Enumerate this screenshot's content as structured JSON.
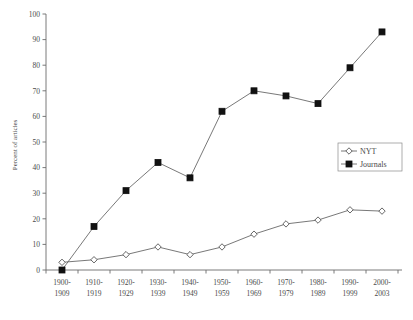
{
  "chart_data": {
    "type": "line",
    "title": "",
    "xlabel": "",
    "ylabel": "Percent of articles",
    "ylim": [
      0,
      100
    ],
    "ytick_step": 10,
    "grid": false,
    "legend_position": "right",
    "categories": [
      "1900-1909",
      "1910-1919",
      "1920-1929",
      "1930-1939",
      "1940-1949",
      "1950-1959",
      "1960-1969",
      "1970-1979",
      "1980-1989",
      "1990-1999",
      "2000-2003"
    ],
    "categories_lines": [
      [
        "1900-",
        "1909"
      ],
      [
        "1910-",
        "1919"
      ],
      [
        "1920-",
        "1929"
      ],
      [
        "1930-",
        "1939"
      ],
      [
        "1940-",
        "1949"
      ],
      [
        "1950-",
        "1959"
      ],
      [
        "1960-",
        "1969"
      ],
      [
        "1970-",
        "1979"
      ],
      [
        "1980-",
        "1989"
      ],
      [
        "1990-",
        "1999"
      ],
      [
        "2000-",
        "2003"
      ]
    ],
    "ytick_labels": [
      "0",
      "10",
      "20",
      "30",
      "40",
      "50",
      "60",
      "70",
      "80",
      "90",
      "100"
    ],
    "ytick_values": [
      0,
      10,
      20,
      30,
      40,
      50,
      60,
      70,
      80,
      90,
      100
    ],
    "series": [
      {
        "name": "NYT",
        "marker": "open-diamond",
        "color": "#555555",
        "values": [
          3,
          4,
          6,
          9,
          6,
          9,
          14,
          18,
          19.5,
          23.5,
          23
        ]
      },
      {
        "name": "Journals",
        "marker": "filled-square",
        "color": "#111111",
        "values": [
          0,
          17,
          31,
          42,
          36,
          62,
          70,
          68,
          65,
          79,
          93
        ]
      }
    ]
  },
  "legend": {
    "entries": [
      {
        "label": "NYT"
      },
      {
        "label": "Journals"
      }
    ]
  },
  "axes": {
    "y_title": "Percent of articles"
  }
}
